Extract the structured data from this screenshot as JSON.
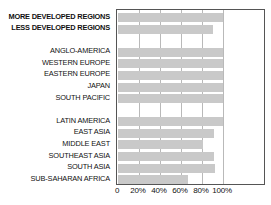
{
  "chart_data": {
    "type": "bar",
    "orientation": "horizontal",
    "title": "",
    "xlabel": "",
    "ylabel": "",
    "xlim": [
      0,
      120
    ],
    "grid": true,
    "legend": null,
    "bar_color": "#c9c9c9",
    "frame_color": "#555555",
    "gridline_color": "#b9b9b9",
    "xticks": [
      {
        "value": 0,
        "label": "0"
      },
      {
        "value": 20,
        "label": "20%"
      },
      {
        "value": 40,
        "label": "40%"
      },
      {
        "value": 60,
        "label": "60%"
      },
      {
        "value": 80,
        "label": "80%"
      },
      {
        "value": 100,
        "label": "100%"
      }
    ],
    "groups": [
      {
        "name": "development-level",
        "bold": true,
        "categories": [
          "MORE DEVELOPED REGIONS",
          "LESS DEVELOPED REGIONS"
        ],
        "values": [
          100,
          90
        ]
      },
      {
        "name": "developed-regions",
        "bold": false,
        "categories": [
          "ANGLO-AMERICA",
          "WESTERN EUROPE",
          "EASTERN EUROPE",
          "JAPAN",
          "SOUTH PACIFIC"
        ],
        "values": [
          100,
          100,
          100,
          100,
          100
        ]
      },
      {
        "name": "developing-regions",
        "bold": false,
        "categories": [
          "LATIN AMERICA",
          "EAST ASIA",
          "MIDDLE EAST",
          "SOUTHEAST ASIA",
          "SOUTH ASIA",
          "SUB-SAHARAN AFRICA"
        ],
        "values": [
          100,
          91,
          81,
          91,
          92,
          67
        ]
      }
    ],
    "categories": [
      "MORE DEVELOPED REGIONS",
      "LESS DEVELOPED REGIONS",
      "ANGLO-AMERICA",
      "WESTERN EUROPE",
      "EASTERN EUROPE",
      "JAPAN",
      "SOUTH PACIFIC",
      "LATIN AMERICA",
      "EAST ASIA",
      "MIDDLE EAST",
      "SOUTHEAST ASIA",
      "SOUTH ASIA",
      "SUB-SAHARAN AFRICA"
    ],
    "values": [
      100,
      90,
      100,
      100,
      100,
      100,
      100,
      100,
      91,
      81,
      91,
      92,
      67
    ]
  }
}
